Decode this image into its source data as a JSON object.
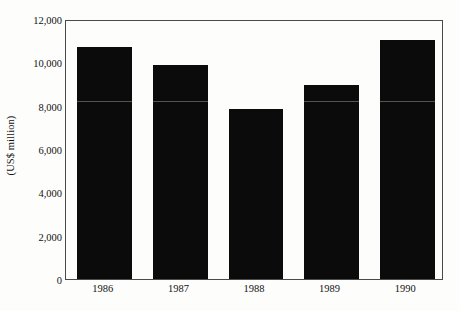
{
  "chart_data": {
    "type": "bar",
    "title": "",
    "subtitle": "",
    "xlabel": "",
    "ylabel": "(US$ million)",
    "categories": [
      "1986",
      "1987",
      "1988",
      "1989",
      "1990"
    ],
    "values": [
      10700,
      9900,
      7850,
      8950,
      11050
    ],
    "series": [
      {
        "name": "",
        "values": [
          10700,
          9900,
          7850,
          8950,
          11050
        ]
      }
    ],
    "ylim": [
      0,
      12000
    ],
    "ytick_values": [
      0,
      2000,
      4000,
      6000,
      8000,
      10000,
      12000
    ],
    "ytick_labels": [
      "0",
      "2,000",
      "4,000",
      "6,000",
      "8,000",
      "10,000",
      "12,000"
    ],
    "xtick_labels": [
      "1986",
      "1987",
      "1988",
      "1989",
      "1990"
    ],
    "grid": false,
    "legend": false,
    "legend_position": "none",
    "bar_color": "#0b0b0b",
    "frame_color": "#4a4a4a",
    "background_color": "#fdfdfc",
    "annotations": []
  }
}
